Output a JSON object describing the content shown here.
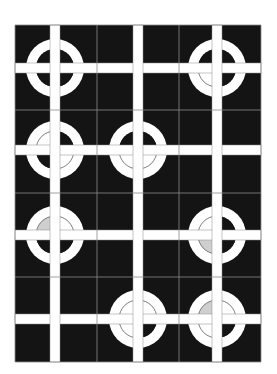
{
  "board": {
    "x": 15,
    "y": 25,
    "width": 246,
    "height": 337,
    "cols": 3,
    "rows": 4,
    "col_edges": [
      15,
      97,
      179,
      261
    ],
    "row_edges": [
      25,
      110,
      193,
      277,
      362
    ],
    "bar_x": [
      55,
      138,
      217
    ],
    "bar_y": [
      68,
      150,
      235,
      319
    ],
    "bar_width": 10,
    "ring_outer_r": 29,
    "ring_inner_r": 19,
    "colors": {
      "background": "#141414",
      "bar": "#ffffff",
      "ring": "#ffffff",
      "grid_line": "#8a8a8a",
      "quarter_white": "#ffffff",
      "quarter_gray": "#cfcfcf",
      "quarter_dark": "#141414",
      "arc_line": "#777777"
    }
  },
  "tiles": [
    {
      "row": 0,
      "col": 0,
      "ring": true,
      "quarters": {
        "tl": "dark",
        "tr": "dark",
        "bl": "dark",
        "br": "dark"
      }
    },
    {
      "row": 0,
      "col": 1,
      "ring": false
    },
    {
      "row": 0,
      "col": 2,
      "ring": true,
      "quarters": {
        "tl": "dark",
        "tr": "dark",
        "bl": "white",
        "br": "dark"
      }
    },
    {
      "row": 1,
      "col": 0,
      "ring": true,
      "quarters": {
        "tl": "white",
        "tr": "dark",
        "bl": "dark",
        "br": "white"
      }
    },
    {
      "row": 1,
      "col": 1,
      "ring": true,
      "quarters": {
        "tl": "dark",
        "tr": "dark",
        "bl": "white",
        "br": "white"
      }
    },
    {
      "row": 1,
      "col": 2,
      "ring": false
    },
    {
      "row": 2,
      "col": 0,
      "ring": true,
      "quarters": {
        "tl": "gray",
        "tr": "white",
        "bl": "dark",
        "br": "dark"
      }
    },
    {
      "row": 2,
      "col": 1,
      "ring": false
    },
    {
      "row": 2,
      "col": 2,
      "ring": true,
      "quarters": {
        "tl": "white",
        "tr": "dark",
        "bl": "gray",
        "br": "dark"
      }
    },
    {
      "row": 3,
      "col": 0,
      "ring": false
    },
    {
      "row": 3,
      "col": 1,
      "ring": true,
      "quarters": {
        "tl": "white",
        "tr": "white",
        "bl": "white",
        "br": "dark"
      }
    },
    {
      "row": 3,
      "col": 2,
      "ring": true,
      "quarters": {
        "tl": "gray",
        "tr": "white",
        "bl": "white",
        "br": "dark"
      }
    }
  ]
}
